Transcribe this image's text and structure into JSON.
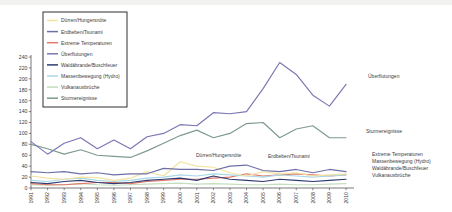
{
  "chart_data": {
    "type": "line",
    "title": "",
    "xlabel": "",
    "ylabel": "",
    "ylim": [
      0,
      240
    ],
    "ytick_step": 20,
    "grid": false,
    "legend_position": "upper-left",
    "yticks": [
      "0",
      "20",
      "40",
      "60",
      "80",
      "100",
      "120",
      "140",
      "160",
      "180",
      "200",
      "220",
      "240"
    ],
    "categories": [
      "1991",
      "1992",
      "1993",
      "1994",
      "1995",
      "1996",
      "1997",
      "1998",
      "1999",
      "2000",
      "2001",
      "2002",
      "2003",
      "2004",
      "2005",
      "2006",
      "2007",
      "2008",
      "2009",
      "2010"
    ],
    "series": [
      {
        "name": "Dürren/Hungersnöte",
        "color": "#f2e3a0",
        "values": [
          22,
          18,
          16,
          20,
          19,
          14,
          18,
          30,
          22,
          48,
          40,
          38,
          28,
          22,
          30,
          26,
          28,
          22,
          24,
          26
        ]
      },
      {
        "name": "Erdbeben/Tsunami",
        "color": "#6f6fa8",
        "values": [
          30,
          28,
          30,
          26,
          28,
          24,
          26,
          26,
          36,
          34,
          34,
          32,
          40,
          42,
          32,
          30,
          34,
          28,
          34,
          30
        ]
      },
      {
        "name": "Extreme Temperaturen",
        "color": "#e07a6a",
        "values": [
          8,
          6,
          6,
          8,
          10,
          10,
          8,
          12,
          14,
          16,
          16,
          18,
          20,
          26,
          22,
          24,
          26,
          24,
          22,
          24
        ]
      },
      {
        "name": "Überflutungen",
        "color": "#7a76b4",
        "values": [
          85,
          62,
          82,
          92,
          72,
          88,
          72,
          94,
          100,
          116,
          114,
          138,
          136,
          140,
          182,
          230,
          208,
          170,
          150,
          190
        ]
      },
      {
        "name": "Waldäbrande/Buschfeuer",
        "color": "#2e3a70",
        "values": [
          10,
          8,
          12,
          14,
          10,
          8,
          10,
          14,
          16,
          18,
          14,
          22,
          16,
          14,
          12,
          16,
          14,
          12,
          14,
          16
        ]
      },
      {
        "name": "Massenbewegung (Hydro)",
        "color": "#a8d8e8",
        "values": [
          14,
          12,
          16,
          18,
          14,
          12,
          14,
          18,
          20,
          24,
          22,
          26,
          24,
          22,
          20,
          24,
          22,
          20,
          22,
          24
        ]
      },
      {
        "name": "Vulkanausbrüche",
        "color": "#c3ddbe",
        "values": [
          6,
          5,
          6,
          8,
          6,
          5,
          6,
          7,
          8,
          9,
          7,
          8,
          7,
          6,
          6,
          7,
          6,
          6,
          7,
          8
        ]
      },
      {
        "name": "Sturmereignisse",
        "color": "#7d9a8c",
        "values": [
          80,
          72,
          62,
          70,
          60,
          58,
          56,
          68,
          82,
          96,
          106,
          92,
          100,
          118,
          120,
          92,
          108,
          114,
          92,
          92
        ]
      }
    ],
    "legend_entries": [
      "Dürren/Hungersnöte",
      "Erdbeben/Tsunami",
      "Extreme Temperaturen",
      "Überflutungen",
      "Waldäbrande/Buschfeuer",
      "Massenbewegung (Hydro)",
      "Vulkanausbrüche",
      "Sturmereignisse"
    ],
    "annotations": [
      {
        "text": "Überflutungen",
        "x": 368,
        "y": 78
      },
      {
        "text": "Sturmereignisse",
        "x": 366,
        "y": 133
      },
      {
        "text": "Dürren/Hungersnöte",
        "x": 196,
        "y": 157
      },
      {
        "text": "Erdbeben/Tsunami",
        "x": 268,
        "y": 158
      },
      {
        "text": "Extreme Temperaturen",
        "x": 372,
        "y": 156
      },
      {
        "text": "Massenbewegung (Hydro)",
        "x": 372,
        "y": 163
      },
      {
        "text": "Waldäbrande/Buschfeuer",
        "x": 372,
        "y": 170
      },
      {
        "text": "Vulkanausbrüche",
        "x": 372,
        "y": 177
      }
    ]
  }
}
